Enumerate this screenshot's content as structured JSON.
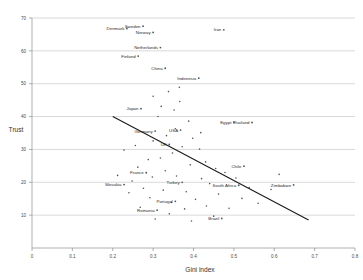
{
  "chart_data": {
    "type": "scatter",
    "title": "",
    "xlabel": "Gini index",
    "ylabel": "Trust",
    "xlim": [
      0,
      0.8
    ],
    "ylim": [
      0,
      70
    ],
    "xticks": [
      "0",
      "0.1",
      "0.2",
      "0.3",
      "0.4",
      "0.5",
      "0.6",
      "0.7",
      "0.8"
    ],
    "xtick_values": [
      0,
      0.1,
      0.2,
      0.3,
      0.4,
      0.5,
      0.6,
      0.7,
      0.8
    ],
    "yticks": [
      "10",
      "20",
      "30",
      "40",
      "50",
      "60",
      "70"
    ],
    "ytick_values": [
      10,
      20,
      30,
      40,
      50,
      60,
      70
    ],
    "grid": true,
    "grid_axis": "y",
    "legend": "none",
    "trendline": {
      "type": "linear",
      "x_start": 0.2,
      "y_start": 40.0,
      "x_end": 0.685,
      "y_end": 8.5,
      "slope": -64.9,
      "intercept": 53.0
    },
    "labeled_points": [
      {
        "label": "Denmark",
        "x": 0.235,
        "y": 66.8
      },
      {
        "label": "Sweden",
        "x": 0.275,
        "y": 67.5
      },
      {
        "label": "Norway",
        "x": 0.3,
        "y": 65.6
      },
      {
        "label": "Iran",
        "x": 0.475,
        "y": 66.4
      },
      {
        "label": "Netherlands",
        "x": 0.318,
        "y": 61.0
      },
      {
        "label": "Finland",
        "x": 0.263,
        "y": 58.4
      },
      {
        "label": "China",
        "x": 0.33,
        "y": 54.7
      },
      {
        "label": "Indonesia",
        "x": 0.413,
        "y": 51.7
      },
      {
        "label": "Japan",
        "x": 0.27,
        "y": 42.4
      },
      {
        "label": "Egypt",
        "x": 0.5,
        "y": 38.2
      },
      {
        "label": "Thailand",
        "x": 0.545,
        "y": 38.2
      },
      {
        "label": "Germany",
        "x": 0.305,
        "y": 35.6
      },
      {
        "label": "USA",
        "x": 0.368,
        "y": 35.9
      },
      {
        "label": "UK",
        "x": 0.34,
        "y": 31.5
      },
      {
        "label": "Chile",
        "x": 0.525,
        "y": 24.9
      },
      {
        "label": "France",
        "x": 0.283,
        "y": 22.9
      },
      {
        "label": "Turkey",
        "x": 0.372,
        "y": 20.0
      },
      {
        "label": "Slovakia",
        "x": 0.228,
        "y": 19.3
      },
      {
        "label": "South Africa",
        "x": 0.512,
        "y": 19.1
      },
      {
        "label": "Zimbabwe",
        "x": 0.648,
        "y": 19.2
      },
      {
        "label": "Portugal",
        "x": 0.355,
        "y": 14.2
      },
      {
        "label": "Romania",
        "x": 0.31,
        "y": 11.5
      },
      {
        "label": "Brazil",
        "x": 0.47,
        "y": 9.0
      }
    ],
    "unlabeled_points": [
      {
        "x": 0.32,
        "y": 43.1
      },
      {
        "x": 0.366,
        "y": 44.6
      },
      {
        "x": 0.352,
        "y": 42.0
      },
      {
        "x": 0.312,
        "y": 40.0
      },
      {
        "x": 0.338,
        "y": 47.6
      },
      {
        "x": 0.388,
        "y": 38.6
      },
      {
        "x": 0.355,
        "y": 36.3
      },
      {
        "x": 0.333,
        "y": 34.2
      },
      {
        "x": 0.398,
        "y": 33.4
      },
      {
        "x": 0.3,
        "y": 32.6
      },
      {
        "x": 0.372,
        "y": 30.8
      },
      {
        "x": 0.415,
        "y": 30.1
      },
      {
        "x": 0.348,
        "y": 28.9
      },
      {
        "x": 0.318,
        "y": 27.4
      },
      {
        "x": 0.288,
        "y": 26.9
      },
      {
        "x": 0.43,
        "y": 26.2
      },
      {
        "x": 0.392,
        "y": 25.3
      },
      {
        "x": 0.455,
        "y": 24.2
      },
      {
        "x": 0.262,
        "y": 24.6
      },
      {
        "x": 0.33,
        "y": 23.5
      },
      {
        "x": 0.478,
        "y": 23.0
      },
      {
        "x": 0.298,
        "y": 21.6
      },
      {
        "x": 0.358,
        "y": 21.9
      },
      {
        "x": 0.42,
        "y": 21.1
      },
      {
        "x": 0.248,
        "y": 20.4
      },
      {
        "x": 0.505,
        "y": 21.3
      },
      {
        "x": 0.44,
        "y": 19.6
      },
      {
        "x": 0.276,
        "y": 18.2
      },
      {
        "x": 0.325,
        "y": 17.6
      },
      {
        "x": 0.382,
        "y": 17.1
      },
      {
        "x": 0.462,
        "y": 16.4
      },
      {
        "x": 0.292,
        "y": 15.3
      },
      {
        "x": 0.405,
        "y": 14.8
      },
      {
        "x": 0.345,
        "y": 13.9
      },
      {
        "x": 0.52,
        "y": 15.1
      },
      {
        "x": 0.432,
        "y": 12.8
      },
      {
        "x": 0.378,
        "y": 11.9
      },
      {
        "x": 0.268,
        "y": 12.4
      },
      {
        "x": 0.488,
        "y": 12.1
      },
      {
        "x": 0.34,
        "y": 10.4
      },
      {
        "x": 0.56,
        "y": 13.6
      },
      {
        "x": 0.592,
        "y": 17.8
      },
      {
        "x": 0.45,
        "y": 9.7
      },
      {
        "x": 0.305,
        "y": 8.8
      },
      {
        "x": 0.395,
        "y": 8.2
      },
      {
        "x": 0.228,
        "y": 29.8
      },
      {
        "x": 0.256,
        "y": 31.2
      },
      {
        "x": 0.24,
        "y": 16.8
      },
      {
        "x": 0.212,
        "y": 22.1
      },
      {
        "x": 0.612,
        "y": 22.4
      },
      {
        "x": 0.538,
        "y": 18.4
      },
      {
        "x": 0.365,
        "y": 48.9
      },
      {
        "x": 0.3,
        "y": 46.2
      },
      {
        "x": 0.418,
        "y": 35.1
      }
    ]
  }
}
